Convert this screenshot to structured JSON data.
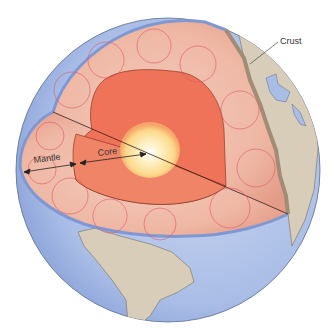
{
  "diagram": {
    "labels": {
      "crust": "Crust",
      "mantle": "Mantle",
      "core": "Core"
    },
    "colors": {
      "ocean": "#a9bde6",
      "ocean_dark": "#7f98d4",
      "land": "#d8cdb8",
      "crust_edge": "#a38c75",
      "mantle": "#f1c2b0",
      "mantle_dark": "#e39a86",
      "outer_core": "#ee7358",
      "inner_core": "#fbe39a",
      "inner_core_center": "#ffffff",
      "convection_arrows": "#e0566a",
      "text": "#333333"
    },
    "features": [
      "convection-cells",
      "outer-core",
      "inner-core",
      "continents",
      "oceans"
    ]
  }
}
